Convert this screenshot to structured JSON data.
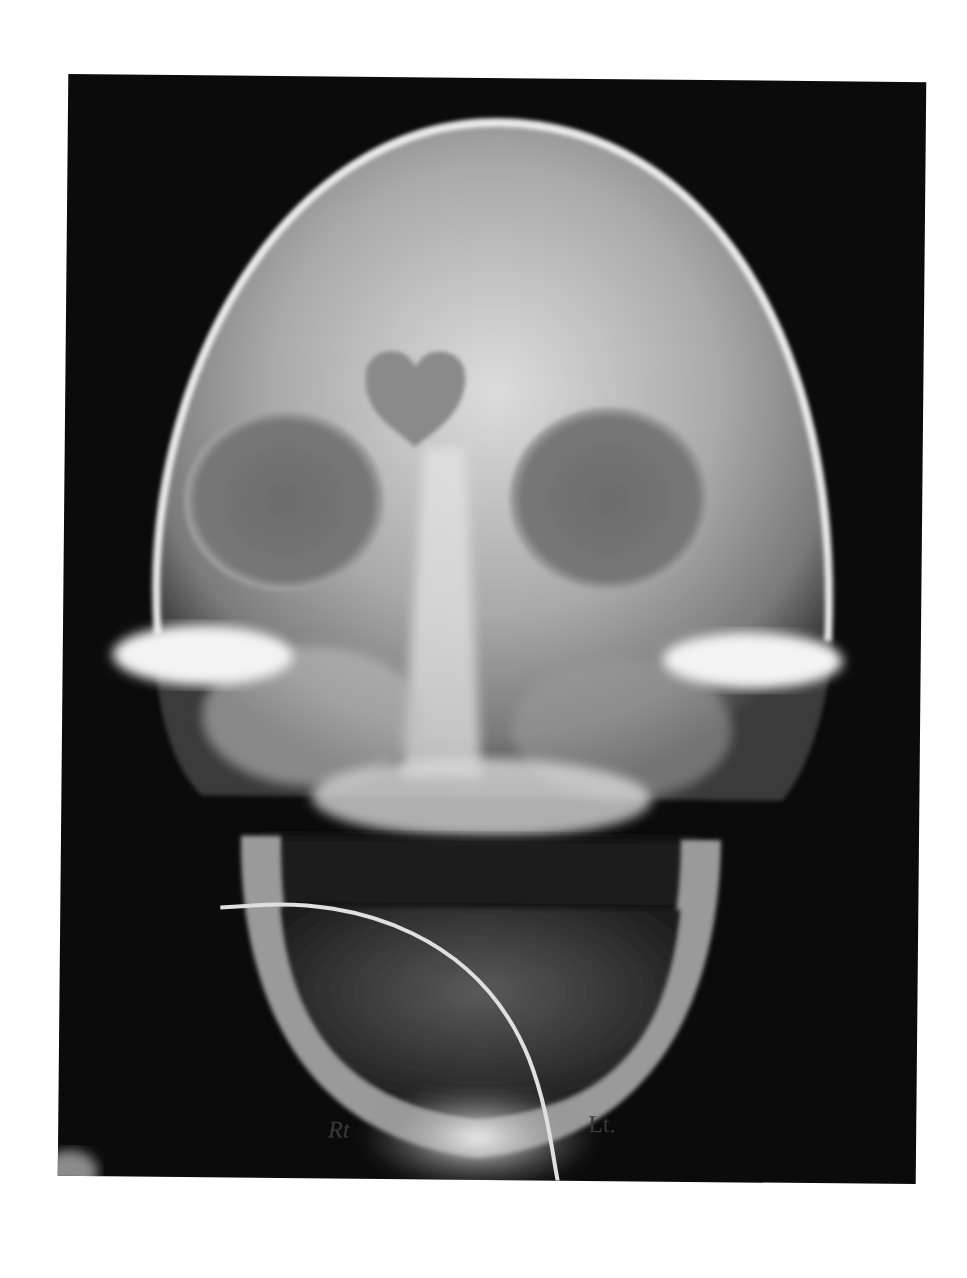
{
  "image": {
    "subject": "Frontal (PA) skull radiograph",
    "background_color": "#ffffff",
    "film_color": "#0b0b0b",
    "bone_color": "#e8e8e8",
    "side_markers": {
      "right": "Rt",
      "left": "Lt."
    }
  }
}
